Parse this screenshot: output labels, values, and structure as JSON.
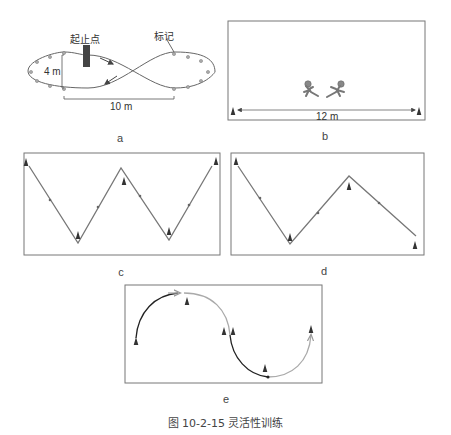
{
  "figure": {
    "caption": "图 10-2-15   灵活性训练",
    "number": "图 10-2-15",
    "title": "灵活性训练"
  },
  "panels": {
    "a": {
      "label": "a",
      "start_label": "起止点",
      "marker_label": "标记",
      "width_label": "4 m",
      "length_label": "10 m",
      "shape": "figure-eight course",
      "marker_count": 16
    },
    "b": {
      "label": "b",
      "distance_label": "12 m",
      "figures": [
        "runner-left",
        "runner-right"
      ],
      "cones": 2
    },
    "c": {
      "label": "c",
      "shape": "W zigzag path",
      "cones": 5
    },
    "d": {
      "label": "d",
      "shape": "N zigzag path",
      "cones": 4
    },
    "e": {
      "label": "e",
      "shape": "S curved path",
      "cones": 6
    }
  },
  "colors": {
    "line": "#555555",
    "box": "#666666",
    "cone": "#333333",
    "marker": "#999999",
    "post": "#444444",
    "light_path": "#aaaaaa",
    "dark_path": "#222222"
  }
}
